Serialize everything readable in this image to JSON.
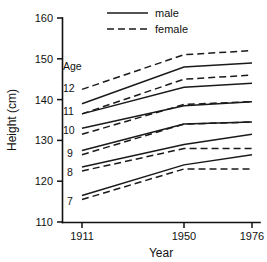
{
  "chart_data": {
    "type": "line",
    "title": "",
    "xlabel": "Year",
    "ylabel": "Height (cm)",
    "x": [
      1911,
      1950,
      1976
    ],
    "xtick_labels": [
      "1911",
      "1950",
      "1976"
    ],
    "ytick_labels": [
      "110",
      "120",
      "130",
      "140",
      "150",
      "160"
    ],
    "yticks": [
      110,
      120,
      130,
      140,
      150,
      160
    ],
    "ylim": [
      110,
      160
    ],
    "grid": false,
    "legend_position": "top-center",
    "legend": [
      {
        "name": "male",
        "style": "solid"
      },
      {
        "name": "female",
        "style": "dashed"
      }
    ],
    "group_label": "Age",
    "age_labels": [
      "12",
      "11",
      "10",
      "9",
      "8",
      "7"
    ],
    "series": [
      {
        "name": "age 12 male",
        "age": "12",
        "sex": "male",
        "style": "solid",
        "values": [
          139.0,
          148.0,
          149.0
        ]
      },
      {
        "name": "age 12 female",
        "age": "12",
        "sex": "female",
        "style": "dashed",
        "values": [
          142.5,
          151.0,
          152.0
        ]
      },
      {
        "name": "age 11 male",
        "age": "11",
        "sex": "male",
        "style": "solid",
        "values": [
          136.5,
          143.0,
          144.0
        ]
      },
      {
        "name": "age 11 female",
        "age": "11",
        "sex": "female",
        "style": "dashed",
        "values": [
          136.5,
          145.0,
          146.0
        ]
      },
      {
        "name": "age 10 male",
        "age": "10",
        "sex": "male",
        "style": "solid",
        "values": [
          133.0,
          138.5,
          139.5
        ]
      },
      {
        "name": "age 10 female",
        "age": "10",
        "sex": "female",
        "style": "dashed",
        "values": [
          131.5,
          138.8,
          139.5
        ]
      },
      {
        "name": "age 9 male",
        "age": "9",
        "sex": "male",
        "style": "solid",
        "values": [
          127.5,
          134.0,
          134.5
        ]
      },
      {
        "name": "age 9 female",
        "age": "9",
        "sex": "female",
        "style": "dashed",
        "values": [
          126.5,
          134.0,
          134.5
        ]
      },
      {
        "name": "age 8 male",
        "age": "8",
        "sex": "male",
        "style": "solid",
        "values": [
          123.5,
          129.0,
          131.5
        ]
      },
      {
        "name": "age 8 female",
        "age": "8",
        "sex": "female",
        "style": "dashed",
        "values": [
          122.5,
          128.0,
          128.0
        ]
      },
      {
        "name": "age 7 male",
        "age": "7",
        "sex": "male",
        "style": "solid",
        "values": [
          116.5,
          124.0,
          126.5
        ]
      },
      {
        "name": "age 7 female",
        "age": "7",
        "sex": "female",
        "style": "dashed",
        "values": [
          115.5,
          123.0,
          123.0
        ]
      }
    ]
  },
  "axes": {
    "x_title": "Year",
    "y_title": "Height (cm)"
  },
  "legend": {
    "male_label": "male",
    "female_label": "female"
  },
  "annotations": {
    "age_header": "Age",
    "age_12": "12",
    "age_11": "11",
    "age_10": "10",
    "age_9": "9",
    "age_8": "8",
    "age_7": "7"
  },
  "ticks": {
    "y_160": "160",
    "y_150": "150",
    "y_140": "140",
    "y_130": "130",
    "y_120": "120",
    "y_110": "110",
    "x_1911": "1911",
    "x_1950": "1950",
    "x_1976": "1976"
  },
  "colors": {
    "ink": "#1a1a1a",
    "background": "#ffffff"
  }
}
